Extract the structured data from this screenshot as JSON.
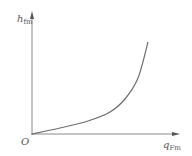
{
  "chart_data": {
    "type": "line",
    "title": "",
    "xlabel": "q_Fm",
    "ylabel": "h_fm",
    "origin_label": "O",
    "grid": false,
    "legend": null,
    "axis_ticks": "none",
    "series": [
      {
        "name": "h_fm vs q_Fm",
        "description": "monotonically increasing convex curve starting at origin",
        "points_px": [
          [
            32,
            134
          ],
          [
            60,
            128
          ],
          [
            88,
            121
          ],
          [
            110,
            112
          ],
          [
            125,
            99
          ],
          [
            138,
            78
          ],
          [
            148,
            42
          ]
        ]
      }
    ]
  },
  "labels": {
    "y_main": "h",
    "y_sub": "fm",
    "x_main": "q",
    "x_sub": "Fm",
    "origin": "O"
  },
  "colors": {
    "axis": "#8a8a8a",
    "curve": "#6e6e6e",
    "text": "#555555"
  }
}
